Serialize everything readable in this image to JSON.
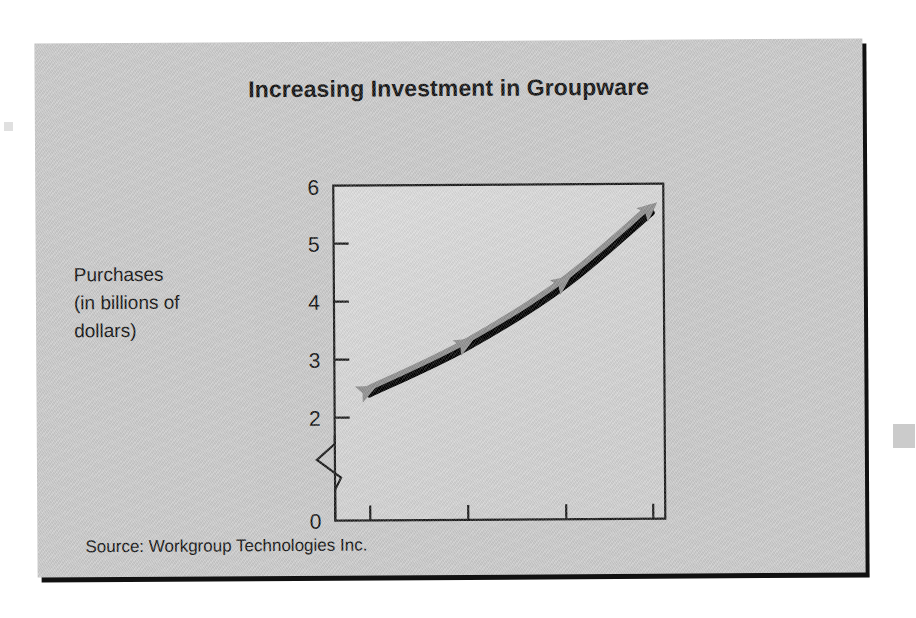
{
  "figure": {
    "title": "Increasing Investment in Groupware",
    "y_caption_line1": "Purchases",
    "y_caption_line2": "(in billions of",
    "y_caption_line3": "dollars)",
    "source": "Source: Workgroup Technologies Inc.",
    "panel_color": "#c9c9c9",
    "plot_bg_color": "#d6d6d6",
    "line_color": "#000000",
    "marker_color": "#8f8f8f",
    "axis_color": "#1a1a1a"
  },
  "chart_data": {
    "type": "line",
    "title": "Increasing Investment in Groupware",
    "subtitle": "",
    "xlabel": "",
    "ylabel": "Purchases (in billions of dollars)",
    "categories": [
      "1995",
      "1996",
      "1997",
      "1998"
    ],
    "x": [
      1995,
      1996,
      1997,
      1998
    ],
    "values": [
      2.4,
      3.2,
      4.25,
      5.5
    ],
    "series": [
      {
        "name": "Purchases",
        "values": [
          2.4,
          3.2,
          4.25,
          5.5
        ]
      }
    ],
    "ytick_labels": [
      "0",
      "2",
      "3",
      "4",
      "5",
      "6"
    ],
    "ytick_values": [
      0,
      2,
      3,
      4,
      5,
      6
    ],
    "ylim": [
      2,
      6
    ],
    "y_axis_broken": true,
    "y_axis_break_between": [
      0,
      2
    ],
    "xtick_labels": [
      "1995",
      "1996",
      "1997",
      "1998"
    ],
    "grid": false,
    "legend": false,
    "annotations": [
      "Source: Workgroup Technologies Inc."
    ],
    "marker_style": "triangle-arrow",
    "line_style": "solid-thick-with-gray-highlight"
  }
}
